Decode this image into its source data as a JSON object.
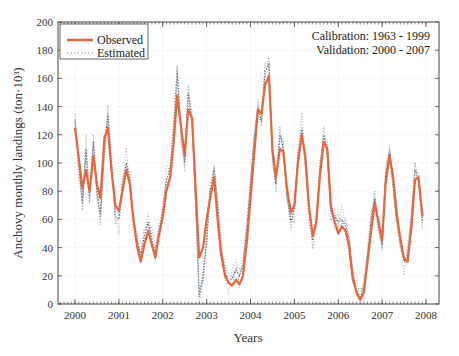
{
  "chart_data": {
    "type": "line",
    "title": "",
    "xlabel": "Years",
    "ylabel": "Anchovy monthly landings (ton·10³)",
    "xlim": [
      2000,
      2008
    ],
    "ylim": [
      0,
      200
    ],
    "x_ticks": [
      "2000",
      "2001",
      "2002",
      "2003",
      "2004",
      "2005",
      "2006",
      "2007",
      "2008"
    ],
    "y_ticks": [
      "0",
      "20",
      "40",
      "60",
      "80",
      "100",
      "120",
      "140",
      "160",
      "180",
      "200"
    ],
    "grid": true,
    "legend_position": "upper left",
    "annotations": [
      "Calibration: 1963 - 1999",
      "Validation: 2000 - 2007"
    ],
    "series": [
      {
        "name": "Observed",
        "style": "solid",
        "color": "#e8663d",
        "x": [
          2000.0,
          2000.08,
          2000.17,
          2000.25,
          2000.33,
          2000.42,
          2000.5,
          2000.58,
          2000.67,
          2000.75,
          2000.83,
          2000.92,
          2001.0,
          2001.08,
          2001.17,
          2001.25,
          2001.33,
          2001.42,
          2001.5,
          2001.58,
          2001.67,
          2001.75,
          2001.83,
          2001.92,
          2002.0,
          2002.08,
          2002.17,
          2002.25,
          2002.33,
          2002.42,
          2002.5,
          2002.58,
          2002.67,
          2002.75,
          2002.83,
          2002.92,
          2003.0,
          2003.08,
          2003.17,
          2003.25,
          2003.33,
          2003.42,
          2003.5,
          2003.58,
          2003.67,
          2003.75,
          2003.83,
          2003.92,
          2004.0,
          2004.08,
          2004.17,
          2004.25,
          2004.33,
          2004.42,
          2004.5,
          2004.58,
          2004.67,
          2004.75,
          2004.83,
          2004.92,
          2005.0,
          2005.08,
          2005.17,
          2005.25,
          2005.33,
          2005.42,
          2005.5,
          2005.58,
          2005.67,
          2005.75,
          2005.83,
          2005.92,
          2006.0,
          2006.08,
          2006.17,
          2006.25,
          2006.33,
          2006.42,
          2006.5,
          2006.58,
          2006.67,
          2006.75,
          2006.83,
          2006.92,
          2007.0,
          2007.08,
          2007.17,
          2007.25,
          2007.33,
          2007.42,
          2007.5,
          2007.58,
          2007.67,
          2007.75,
          2007.83,
          2007.92
        ],
        "values": [
          125,
          105,
          82,
          95,
          80,
          105,
          85,
          75,
          118,
          125,
          95,
          70,
          66,
          80,
          95,
          85,
          60,
          40,
          30,
          42,
          52,
          42,
          33,
          50,
          62,
          80,
          90,
          115,
          148,
          125,
          105,
          138,
          132,
          80,
          33,
          40,
          60,
          75,
          90,
          60,
          35,
          20,
          15,
          13,
          17,
          14,
          20,
          45,
          75,
          105,
          138,
          135,
          155,
          162,
          110,
          90,
          110,
          108,
          82,
          65,
          70,
          100,
          120,
          105,
          70,
          48,
          58,
          90,
          115,
          110,
          70,
          58,
          50,
          55,
          52,
          40,
          18,
          8,
          3,
          8,
          30,
          52,
          72,
          58,
          45,
          85,
          105,
          90,
          65,
          45,
          32,
          30,
          55,
          88,
          90,
          62
        ]
      },
      {
        "name": "Estimated",
        "style": "dotted",
        "color": "#556070",
        "x": [
          2000.0,
          2000.08,
          2000.17,
          2000.25,
          2000.33,
          2000.42,
          2000.5,
          2000.58,
          2000.67,
          2000.75,
          2000.83,
          2000.92,
          2001.0,
          2001.08,
          2001.17,
          2001.25,
          2001.33,
          2001.42,
          2001.5,
          2001.58,
          2001.67,
          2001.75,
          2001.83,
          2001.92,
          2002.0,
          2002.08,
          2002.17,
          2002.25,
          2002.33,
          2002.42,
          2002.5,
          2002.58,
          2002.67,
          2002.75,
          2002.83,
          2002.92,
          2003.0,
          2003.08,
          2003.17,
          2003.25,
          2003.33,
          2003.42,
          2003.5,
          2003.58,
          2003.67,
          2003.75,
          2003.83,
          2003.92,
          2004.0,
          2004.08,
          2004.17,
          2004.25,
          2004.33,
          2004.42,
          2004.5,
          2004.58,
          2004.67,
          2004.75,
          2004.83,
          2004.92,
          2005.0,
          2005.08,
          2005.17,
          2005.25,
          2005.33,
          2005.42,
          2005.5,
          2005.58,
          2005.67,
          2005.75,
          2005.83,
          2005.92,
          2006.0,
          2006.08,
          2006.17,
          2006.25,
          2006.33,
          2006.42,
          2006.5,
          2006.58,
          2006.67,
          2006.75,
          2006.83,
          2006.92,
          2007.0,
          2007.08,
          2007.17,
          2007.25,
          2007.33,
          2007.42,
          2007.5,
          2007.58,
          2007.67,
          2007.75,
          2007.83,
          2007.92
        ],
        "values": [
          130,
          100,
          72,
          110,
          75,
          115,
          80,
          62,
          110,
          135,
          100,
          62,
          60,
          85,
          100,
          88,
          58,
          45,
          35,
          48,
          58,
          46,
          36,
          52,
          66,
          88,
          95,
          125,
          165,
          120,
          100,
          150,
          130,
          70,
          5,
          20,
          45,
          80,
          95,
          70,
          40,
          22,
          16,
          18,
          24,
          20,
          28,
          55,
          85,
          115,
          140,
          130,
          165,
          170,
          105,
          85,
          120,
          110,
          78,
          58,
          68,
          105,
          125,
          100,
          65,
          45,
          60,
          95,
          120,
          108,
          65,
          62,
          58,
          60,
          55,
          45,
          22,
          10,
          5,
          12,
          35,
          60,
          75,
          55,
          42,
          92,
          108,
          85,
          60,
          42,
          30,
          35,
          62,
          95,
          88,
          58
        ]
      }
    ]
  },
  "legend": {
    "observed_label": "Observed",
    "estimated_label": "Estimated"
  },
  "annotation": {
    "line1": "Calibration: 1963 - 1999",
    "line2": "Validation: 2000 - 2007"
  },
  "axes": {
    "xlabel": "Years",
    "ylabel": "Anchovy monthly landings (ton·10³)"
  },
  "colors": {
    "observed": "#e8663d",
    "estimated": "#556070",
    "axis": "#444444",
    "grid": "#e6e6e6"
  }
}
